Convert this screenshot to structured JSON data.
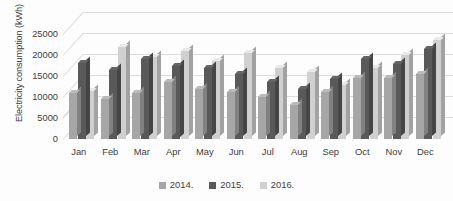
{
  "chart_data": {
    "type": "bar",
    "title": "",
    "subtitle": "",
    "xlabel": "",
    "ylabel": "Electricity consumption (kWh)",
    "categories": [
      "Jan",
      "Feb",
      "Mar",
      "Apr",
      "May",
      "Jun",
      "Jul",
      "Aug",
      "Sep",
      "Oct",
      "Nov",
      "Dec"
    ],
    "series": [
      {
        "name": "2014.",
        "color": "#a6a6a6",
        "values": [
          11000,
          9500,
          11000,
          13500,
          12000,
          11200,
          10000,
          8000,
          11200,
          14500,
          14500,
          15500
        ]
      },
      {
        "name": "2015.",
        "color": "#595959",
        "values": [
          18000,
          16500,
          19000,
          17500,
          17000,
          15500,
          13500,
          11800,
          14300,
          19000,
          17800,
          21500
        ]
      },
      {
        "name": "2016.",
        "color": "#d0d0d0",
        "values": [
          11500,
          22000,
          19500,
          21000,
          18500,
          20500,
          17000,
          16000,
          12800,
          17000,
          20000,
          23500
        ]
      }
    ],
    "ylim": [
      0,
      25000
    ],
    "ytick_step": 5000,
    "ytick_labels": [
      "0",
      "5000",
      "10000",
      "15000",
      "20000",
      "25000"
    ],
    "grid": true,
    "legend_position": "bottom",
    "perspective": "3d"
  },
  "legend": {
    "items": [
      {
        "label": "2014.",
        "color": "#a6a6a6",
        "swatch_name": "legend-swatch-2014"
      },
      {
        "label": "2015.",
        "color": "#595959",
        "swatch_name": "legend-swatch-2015"
      },
      {
        "label": "2016.",
        "color": "#d0d0d0",
        "swatch_name": "legend-swatch-2016"
      }
    ]
  },
  "colors": {
    "series_2014": "#a6a6a6",
    "series_2015": "#595959",
    "series_2016": "#d0d0d0",
    "gridline": "#dcdcdc",
    "text": "#3d3d3d",
    "background": "#fdfdfd"
  }
}
